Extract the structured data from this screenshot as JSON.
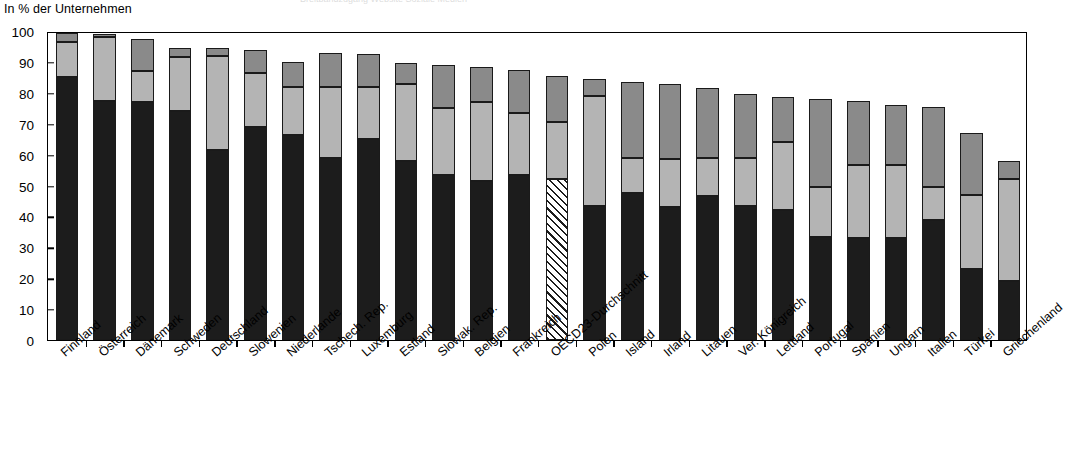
{
  "axis": {
    "y_title": "In % der Unternehmen",
    "y_ticks": [
      "100",
      "90",
      "80",
      "70",
      "60",
      "50",
      "40",
      "30",
      "20",
      "10",
      "0"
    ]
  },
  "legend_clipped": {
    "text": "Breitbandzugang   Website   Soziale Medien"
  },
  "chart_data": {
    "type": "bar",
    "subtype": "stacked-bar",
    "title": "",
    "subtitle": "",
    "xlabel": "",
    "ylabel": "In % der Unternehmen",
    "ylim": [
      0,
      100
    ],
    "ytick_step": 10,
    "grid": false,
    "legend_position": "top (clipped)",
    "highlight_category": "OECD23-Durchschnitt",
    "highlight_style": "diagonal-hatch",
    "categories": [
      "Finnland",
      "Österreich",
      "Dänemark",
      "Schweden",
      "Deutschland",
      "Slowenien",
      "Niederlande",
      "Tschech. Rep.",
      "Luxemburg",
      "Estland",
      "Slowak. Rep.",
      "Belgien",
      "Frankreich",
      "OECD23-Durchschnitt",
      "Polen",
      "Island",
      "Irland",
      "Litauen",
      "Ver. Königreich",
      "Lettland",
      "Portugal",
      "Spanien",
      "Ungarn",
      "Italien",
      "Türkei",
      "Griechenland"
    ],
    "series": [
      {
        "name": "Segment 1 (unten)",
        "color": "#1c1c1c",
        "values": [
          85,
          77.5,
          77,
          74,
          61.5,
          69,
          66.5,
          59,
          65,
          58,
          53.5,
          51.5,
          53.5,
          52,
          43.5,
          47.5,
          43,
          46.5,
          43.5,
          42,
          33.5,
          33,
          33,
          39,
          23,
          19
        ]
      },
      {
        "name": "Segment 2 (Mitte)",
        "color": "#b4b4b4",
        "values": [
          11.5,
          20.5,
          10,
          17.5,
          30.5,
          17.5,
          15.5,
          23,
          17,
          25,
          21.5,
          25.5,
          20,
          18.5,
          35.5,
          11.5,
          15.5,
          12.5,
          15.5,
          22,
          16,
          23.5,
          23.5,
          10.5,
          24,
          33
        ]
      },
      {
        "name": "Segment 3 (oben)",
        "color": "#8a8a8a",
        "values": [
          3,
          1,
          10.5,
          3,
          2.5,
          7.5,
          8,
          11,
          10.5,
          6.5,
          14,
          11.5,
          14,
          15,
          5.5,
          24.5,
          24.5,
          22.5,
          20.5,
          14.5,
          28.5,
          21,
          19.5,
          26,
          20,
          6
        ]
      }
    ],
    "totals": [
      99.5,
      99,
      97.5,
      94.5,
      94.5,
      94,
      90,
      93,
      92.5,
      89.5,
      89,
      88.5,
      87.5,
      85.5,
      84.5,
      83.5,
      83,
      81.5,
      79.5,
      78.5,
      77.5,
      77.5,
      76,
      75.5,
      67,
      58
    ]
  }
}
